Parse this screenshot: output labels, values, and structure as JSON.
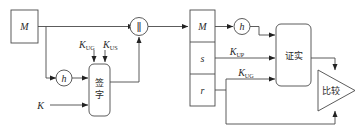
{
  "diagram": {
    "stroke_color": "#4a4a4a",
    "arrow_color": "#222222",
    "background": "#ffffff"
  },
  "sign_side": {
    "message_box_label": "M",
    "hash_node_label": "h",
    "key_input_label": "K",
    "sign_box_label": "签字",
    "sign_box_char1": "签",
    "sign_box_char2": "字",
    "key_ug_base": "K",
    "key_ug_sub": "UG",
    "key_us_base": "K",
    "key_us_sub": "US",
    "concat_symbol": "∥"
  },
  "verify_side": {
    "packet_rows": [
      "M",
      "s",
      "r"
    ],
    "packet_row_m": "M",
    "packet_row_s": "s",
    "packet_row_r": "r",
    "hash_node_label": "h",
    "verify_box_label": "证实",
    "verify_box_char1": "证",
    "verify_box_char2": "实",
    "compare_label": "比较",
    "compare_char1": "比",
    "compare_char2": "较",
    "key_up_base": "K",
    "key_up_sub": "UP",
    "key_ug_base": "K",
    "key_ug_sub": "UG"
  }
}
